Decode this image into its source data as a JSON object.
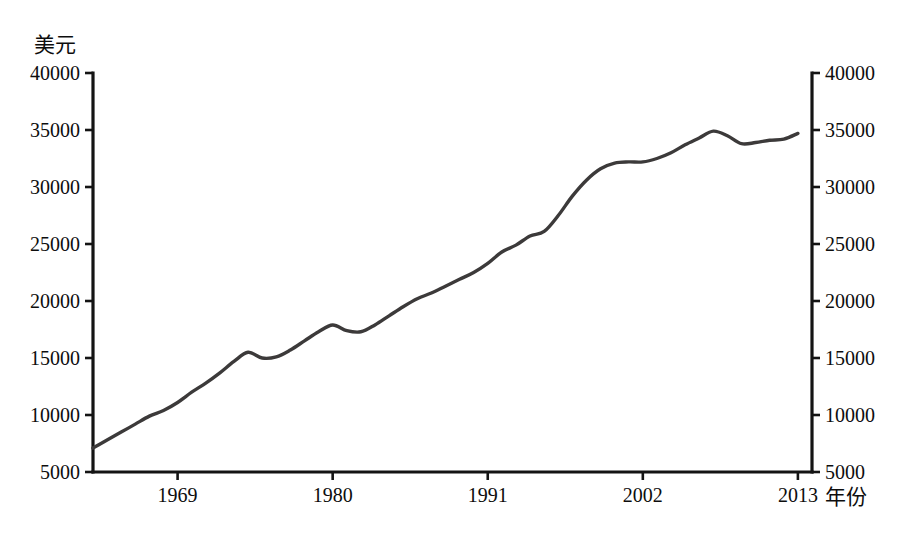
{
  "chart_data": {
    "type": "line",
    "title": "",
    "subtitle": "",
    "xlabel": "年份",
    "ylabel": "美元",
    "ylabel_position": "top-left",
    "xlabel_position": "bottom-right",
    "grid": false,
    "legend": false,
    "legend_position": "none",
    "line_color": "#3c3a3a",
    "axis_color": "#141414",
    "background_color": "#ffffff",
    "xlim": [
      1963,
      2014
    ],
    "ylim": [
      5000,
      40000
    ],
    "x_ticks": [
      1969,
      1980,
      1991,
      2002,
      2013
    ],
    "x_tick_labels": [
      "1969",
      "1980",
      "1991",
      "2002",
      "2013"
    ],
    "y_ticks": [
      5000,
      10000,
      15000,
      20000,
      25000,
      30000,
      35000,
      40000
    ],
    "y_tick_labels": [
      "5000",
      "10000",
      "15000",
      "20000",
      "25000",
      "30000",
      "35000",
      "40000"
    ],
    "y_axis_right_mirrored": true,
    "y_tick_labels_right": [
      "5000",
      "10000",
      "15000",
      "20000",
      "25000",
      "30000",
      "35000",
      "40000"
    ],
    "series": [
      {
        "name": "人均收入",
        "x": [
          1963,
          1964,
          1965,
          1966,
          1967,
          1968,
          1969,
          1970,
          1971,
          1972,
          1973,
          1974,
          1975,
          1976,
          1977,
          1978,
          1979,
          1980,
          1981,
          1982,
          1983,
          1984,
          1985,
          1986,
          1987,
          1988,
          1989,
          1990,
          1991,
          1992,
          1993,
          1994,
          1995,
          1996,
          1997,
          1998,
          1999,
          2000,
          2001,
          2002,
          2003,
          2004,
          2005,
          2006,
          2007,
          2008,
          2009,
          2010,
          2011,
          2012,
          2013
        ],
        "values": [
          7100,
          7800,
          8500,
          9200,
          9900,
          10400,
          11100,
          12000,
          12800,
          13700,
          14700,
          15500,
          15000,
          15100,
          15700,
          16500,
          17300,
          17900,
          17400,
          17300,
          17900,
          18700,
          19500,
          20200,
          20700,
          21300,
          21900,
          22500,
          23300,
          24300,
          24900,
          25700,
          26100,
          27500,
          29200,
          30600,
          31600,
          32100,
          32200,
          32200,
          32500,
          33000,
          33700,
          34300,
          34900,
          34500,
          33800,
          33900,
          34100,
          34200,
          34700
        ]
      }
    ],
    "annotations": []
  },
  "axis": {
    "y_left_title": "美元",
    "y_right_title": "",
    "x_right_title": "年份"
  },
  "caption": {
    "text": ""
  }
}
